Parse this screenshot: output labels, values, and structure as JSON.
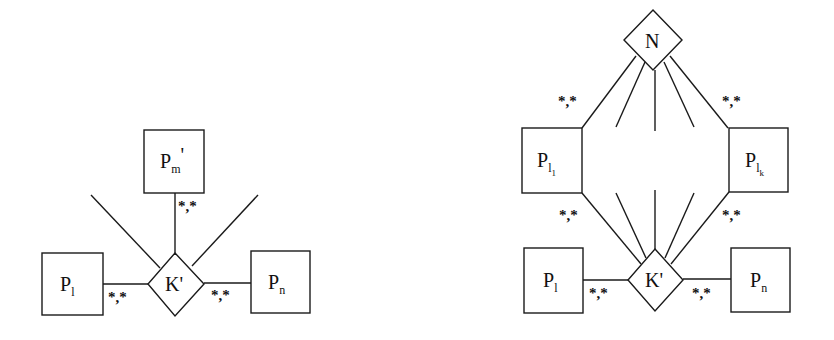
{
  "diagrams": {
    "left": {
      "relationship": {
        "label": "K",
        "prime": "'"
      },
      "entities": {
        "pm": {
          "label": "P",
          "sub": "m",
          "prime": "'"
        },
        "pl": {
          "label": "P",
          "sub": "l"
        },
        "pn": {
          "label": "P",
          "sub": "n"
        }
      },
      "cardinalities": {
        "pm": "*,*",
        "pl": "*,*",
        "pn": "*,*"
      }
    },
    "right": {
      "top_relationship": {
        "label": "N"
      },
      "relationship": {
        "label": "K",
        "prime": "'"
      },
      "entities": {
        "pl1": {
          "label": "P",
          "sub": "l",
          "subsub": "1"
        },
        "plk": {
          "label": "P",
          "sub": "l",
          "subsub": "k"
        },
        "pl": {
          "label": "P",
          "sub": "l"
        },
        "pn": {
          "label": "P",
          "sub": "n"
        }
      },
      "cardinalities": {
        "pl1_top": "*,*",
        "plk_top": "*,*",
        "pl1_bottom": "*,*",
        "plk_bottom": "*,*",
        "pl": "*,*",
        "pn": "*,*"
      }
    }
  }
}
